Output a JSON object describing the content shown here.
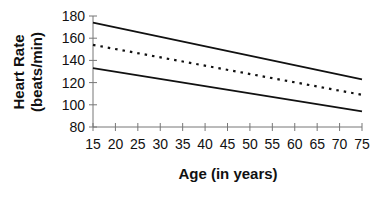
{
  "chart_data": {
    "type": "line",
    "title": "",
    "xlabel": "Age (in years)",
    "ylabel": [
      "Heart Rate",
      "(beats/min)"
    ],
    "xlim": [
      15,
      75
    ],
    "ylim": [
      80,
      180
    ],
    "x_ticks": [
      15,
      20,
      25,
      30,
      35,
      40,
      45,
      50,
      55,
      60,
      65,
      70,
      75
    ],
    "y_ticks": [
      80,
      100,
      120,
      140,
      160,
      180
    ],
    "grid": false,
    "legend": null,
    "x": [
      15,
      75
    ],
    "series": [
      {
        "name": "upper",
        "style": "solid",
        "values": [
          174,
          123
        ]
      },
      {
        "name": "middle",
        "style": "dotted",
        "values": [
          154,
          109
        ]
      },
      {
        "name": "lower",
        "style": "solid",
        "values": [
          133,
          94
        ]
      }
    ]
  }
}
